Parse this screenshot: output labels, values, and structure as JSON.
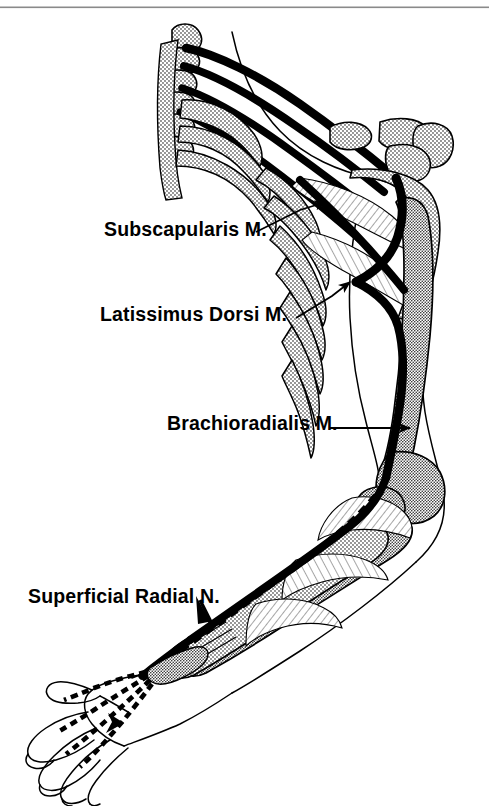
{
  "figure": {
    "background_color": "#ffffff",
    "ink_color": "#000000",
    "rule_color": "#8a8a8a"
  },
  "labels": [
    {
      "id": "subscapularis",
      "text": "Subscapularis M.",
      "leader": "line-with-arrowhead",
      "points_to": "subscapularis-muscle"
    },
    {
      "id": "latissimus",
      "text": "Latissimus Dorsi M.",
      "leader": "line-with-arrowhead",
      "points_to": "latissimus-dorsi-muscle"
    },
    {
      "id": "brachioradialis",
      "text": "Brachioradialis M.",
      "leader": "line-with-arrowhead",
      "points_to": "brachioradialis-muscle"
    },
    {
      "id": "superficial_radial",
      "text": "Superficial Radial N.",
      "leader": "short-arrow",
      "points_to": "superficial-radial-nerve"
    }
  ],
  "structures": {
    "nerve_roots_count": 4,
    "nerve_style_main": "solid-thick-black",
    "nerve_style_superficial": "dashed-segmented-black",
    "bone_fill": "stippled-dot-pattern",
    "muscle_fill": "fine-hatched-lines",
    "outline_style": "thin-black-contour",
    "parts": [
      "cervical-vertebrae",
      "brachial-plexus-roots",
      "ribs",
      "clavicle",
      "acromion",
      "scapula",
      "humerus",
      "radius",
      "ulna",
      "carpal-bones",
      "metacarpals",
      "hand-dorsum",
      "fingers",
      "thumb"
    ]
  }
}
